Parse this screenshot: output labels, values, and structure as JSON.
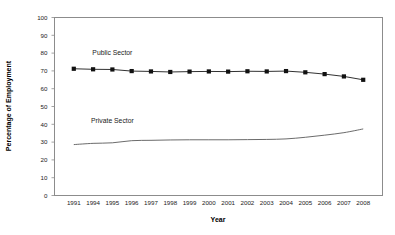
{
  "chart_data": {
    "type": "line",
    "title": "",
    "xlabel": "Year",
    "ylabel": "Percentage of Employment",
    "categories": [
      "1991",
      "1994",
      "1995",
      "1996",
      "1997",
      "1998",
      "1999",
      "2000",
      "2001",
      "2002",
      "2003",
      "2004",
      "2005",
      "2006",
      "2007",
      "2008"
    ],
    "ylim": [
      0,
      100
    ],
    "yticks": [
      0,
      10,
      20,
      30,
      40,
      50,
      60,
      70,
      80,
      90,
      100
    ],
    "grid": false,
    "legend_position": "inline-annotations",
    "series": [
      {
        "name": "Public Sector",
        "marker": "square",
        "color": "#111111",
        "values": [
          71.2,
          70.9,
          70.8,
          69.9,
          69.7,
          69.4,
          69.6,
          69.7,
          69.6,
          69.8,
          69.7,
          69.9,
          69.2,
          68.2,
          66.9,
          65.0
        ]
      },
      {
        "name": "Private Sector",
        "marker": "none",
        "color": "#5a5a5a",
        "values": [
          28.6,
          29.3,
          29.6,
          30.8,
          31.0,
          31.2,
          31.3,
          31.3,
          31.3,
          31.4,
          31.5,
          31.8,
          32.7,
          33.9,
          35.3,
          37.4
        ]
      }
    ],
    "annotations": [
      {
        "text": "Public Sector",
        "x_category": "1995",
        "y_value": 79
      },
      {
        "text": "Private Sector",
        "x_category": "1995",
        "y_value": 41
      }
    ]
  },
  "axes": {
    "x_title": "Year",
    "y_title": "Percentage of Employment"
  }
}
